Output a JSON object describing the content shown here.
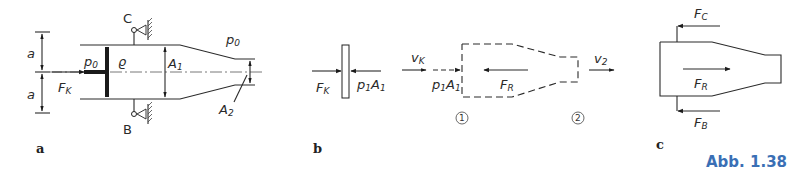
{
  "figure": {
    "caption": "Abb. 1.38",
    "caption_color": "#3a6fb5",
    "panels": {
      "a": {
        "label": "a",
        "dim_a_top": "a",
        "dim_a_bottom": "a",
        "p0_left": "p",
        "p0_left_sub": "0",
        "rho": "ϱ",
        "A1": "A",
        "A1_sub": "1",
        "p0_right": "p",
        "p0_right_sub": "0",
        "A2": "A",
        "A2_sub": "2",
        "FK": "F",
        "FK_sub": "K",
        "support_top": "C",
        "support_bottom": "B"
      },
      "b": {
        "label": "b",
        "FK": "F",
        "FK_sub": "K",
        "p1A1_left": "p",
        "p1A1_left_sub1": "1",
        "p1A1_left_A": "A",
        "p1A1_left_sub2": "1",
        "vK": "v",
        "vK_sub": "K",
        "p1A1_right": "p",
        "p1A1_right_sub1": "1",
        "p1A1_right_A": "A",
        "p1A1_right_sub2": "1",
        "FR": "F",
        "FR_sub": "R",
        "v2": "v",
        "v2_sub": "2",
        "section1": "1",
        "section2": "2"
      },
      "c": {
        "label": "c",
        "FC": "F",
        "FC_sub": "C",
        "FR": "F",
        "FR_sub": "R",
        "FB": "F",
        "FB_sub": "B"
      }
    }
  }
}
